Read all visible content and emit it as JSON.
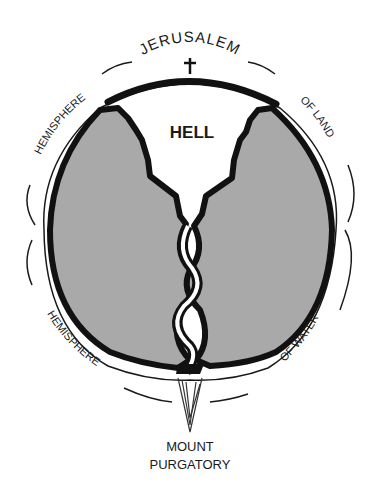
{
  "diagram": {
    "labels": {
      "top": "JERUSALEM",
      "upper_left": "HEMISPHERE",
      "upper_right": "OF LAND",
      "lower_left": "HEMISPHERE",
      "lower_right": "OF WATER",
      "center": "HELL",
      "bottom_line1": "MOUNT",
      "bottom_line2": "PURGATORY"
    },
    "icons": {
      "cross": "cross-icon"
    },
    "colors": {
      "earth_fill": "#a9a9a9",
      "outline": "#111111",
      "background": "#ffffff"
    }
  }
}
